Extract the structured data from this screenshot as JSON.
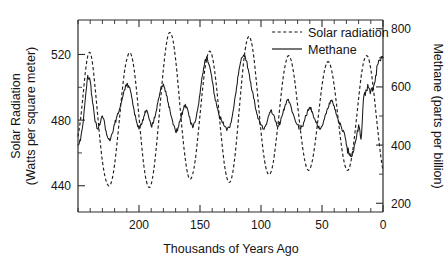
{
  "chart_data": {
    "type": "line",
    "title": "",
    "xlabel": "Thousands of Years Ago",
    "ylabel": "Solar Radiation\n(Watts per square meter)",
    "ylabel_line1": "Solar Radiation",
    "ylabel_line2": "(Watts per square meter)",
    "y2label": "Methane (parts per billion)",
    "xlim": [
      250,
      0
    ],
    "x_reversed": true,
    "ylim": [
      424,
      541
    ],
    "y2lim": [
      170,
      830
    ],
    "grid": false,
    "legend_position": "top-right",
    "xticks": [
      200,
      150,
      100,
      50,
      0
    ],
    "xticklabels": [
      "200",
      "150",
      "100",
      "50",
      "0"
    ],
    "x_minor_tick_step": 10,
    "yticks": [
      440,
      480,
      520
    ],
    "yticklabels": [
      "440",
      "480",
      "520"
    ],
    "y_minor_ticks": [
      460,
      500
    ],
    "y2ticks": [
      200,
      400,
      600,
      800
    ],
    "y2ticklabels": [
      "200",
      "400",
      "600",
      "800"
    ],
    "y2_minor_ticks": [
      300,
      500,
      700
    ],
    "legend": [
      {
        "name": "Solar radiation",
        "style": "dashed",
        "axis": "left"
      },
      {
        "name": "Methane",
        "style": "solid",
        "axis": "right"
      }
    ],
    "series": [
      {
        "name": "Solar radiation",
        "axis": "left",
        "units": "Watts per square meter",
        "style": "dashed",
        "x": [
          250,
          248,
          246,
          244,
          242,
          240,
          238,
          236,
          234,
          232,
          230,
          228,
          226,
          224,
          222,
          220,
          218,
          216,
          214,
          212,
          210,
          208,
          206,
          204,
          202,
          200,
          198,
          196,
          194,
          192,
          190,
          188,
          186,
          184,
          182,
          180,
          178,
          176,
          174,
          172,
          170,
          168,
          166,
          164,
          162,
          160,
          158,
          156,
          154,
          152,
          150,
          148,
          146,
          144,
          142,
          140,
          138,
          136,
          134,
          132,
          130,
          128,
          126,
          124,
          122,
          120,
          118,
          116,
          114,
          112,
          110,
          108,
          106,
          104,
          102,
          100,
          98,
          96,
          94,
          92,
          90,
          88,
          86,
          84,
          82,
          80,
          78,
          76,
          74,
          72,
          70,
          68,
          66,
          64,
          62,
          60,
          58,
          56,
          54,
          52,
          50,
          48,
          46,
          44,
          42,
          40,
          38,
          36,
          34,
          32,
          30,
          28,
          26,
          24,
          22,
          20,
          18,
          16,
          14,
          12,
          10,
          8,
          6,
          4,
          2,
          0
        ],
        "y": [
          470,
          480,
          494,
          509,
          519,
          521,
          514,
          500,
          484,
          468,
          455,
          446,
          441,
          440,
          444,
          453,
          466,
          481,
          496,
          509,
          517,
          521,
          519,
          511,
          498,
          482,
          466,
          452,
          443,
          439,
          441,
          449,
          462,
          478,
          495,
          511,
          524,
          532,
          533,
          528,
          517,
          502,
          485,
          469,
          456,
          447,
          444,
          447,
          455,
          468,
          483,
          498,
          511,
          519,
          522,
          519,
          510,
          497,
          481,
          466,
          453,
          445,
          442,
          445,
          454,
          468,
          485,
          502,
          517,
          527,
          531,
          528,
          519,
          505,
          489,
          473,
          460,
          451,
          447,
          448,
          454,
          465,
          478,
          492,
          505,
          514,
          519,
          518,
          512,
          502,
          489,
          476,
          464,
          455,
          450,
          450,
          455,
          464,
          476,
          489,
          501,
          510,
          515,
          515,
          510,
          501,
          489,
          476,
          464,
          455,
          450,
          450,
          456,
          466,
          479,
          493,
          506,
          515,
          519,
          518,
          511,
          500,
          486,
          472,
          459,
          449
        ]
      },
      {
        "name": "Methane",
        "axis": "right",
        "units": "parts per billion",
        "style": "solid",
        "x": [
          250,
          248,
          246,
          244,
          242,
          240,
          238,
          236,
          234,
          232,
          230,
          228,
          226,
          224,
          222,
          220,
          218,
          216,
          214,
          212,
          210,
          208,
          206,
          204,
          202,
          200,
          198,
          196,
          194,
          192,
          190,
          188,
          186,
          184,
          182,
          180,
          178,
          176,
          174,
          172,
          170,
          168,
          166,
          164,
          162,
          160,
          158,
          156,
          154,
          152,
          150,
          148,
          146,
          144,
          142,
          140,
          138,
          136,
          134,
          132,
          130,
          128,
          126,
          124,
          122,
          120,
          118,
          116,
          114,
          112,
          110,
          108,
          106,
          104,
          102,
          100,
          98,
          96,
          94,
          92,
          90,
          88,
          86,
          84,
          82,
          80,
          78,
          76,
          74,
          72,
          70,
          68,
          66,
          64,
          62,
          60,
          58,
          56,
          54,
          52,
          50,
          48,
          46,
          44,
          42,
          40,
          38,
          36,
          34,
          32,
          30,
          28,
          26,
          24,
          22,
          20,
          18,
          16,
          14,
          12,
          10,
          8,
          6,
          4,
          2,
          0
        ],
        "y": [
          400,
          415,
          470,
          560,
          640,
          620,
          545,
          480,
          455,
          470,
          500,
          470,
          430,
          415,
          440,
          470,
          500,
          525,
          555,
          590,
          610,
          600,
          565,
          520,
          480,
          455,
          470,
          500,
          520,
          495,
          465,
          480,
          515,
          560,
          600,
          610,
          585,
          545,
          505,
          470,
          445,
          460,
          490,
          520,
          540,
          520,
          485,
          460,
          480,
          520,
          575,
          640,
          690,
          700,
          670,
          620,
          570,
          530,
          500,
          480,
          465,
          450,
          460,
          490,
          540,
          600,
          660,
          700,
          710,
          690,
          650,
          600,
          560,
          520,
          490,
          470,
          455,
          470,
          500,
          520,
          505,
          480,
          465,
          480,
          510,
          540,
          555,
          540,
          510,
          485,
          470,
          455,
          465,
          490,
          515,
          530,
          515,
          490,
          470,
          455,
          465,
          490,
          520,
          545,
          555,
          535,
          505,
          480,
          460,
          445,
          400,
          370,
          360,
          380,
          420,
          470,
          420,
          560,
          590,
          600,
          585,
          600,
          640,
          680,
          690,
          700
        ]
      }
    ]
  }
}
